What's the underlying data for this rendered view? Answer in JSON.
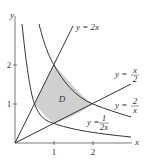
{
  "figure": {
    "axes": {
      "x_label": "x",
      "y_label": "y",
      "x_ticks": [
        "1",
        "2"
      ],
      "y_ticks": [
        "1",
        "2"
      ]
    },
    "curves": [
      {
        "id": "line-2x",
        "label": "y = 2x"
      },
      {
        "id": "line-x2",
        "label_prefix": "y =",
        "label_num": "x",
        "label_den": "2"
      },
      {
        "id": "hyp-2x",
        "label_prefix": "y =",
        "label_num": "2",
        "label_den": "x"
      },
      {
        "id": "hyp-1-2x",
        "label_prefix": "y =",
        "label_num": "1",
        "label_den": "2x"
      }
    ],
    "region": {
      "label": "D",
      "fill": "#d0d0d0"
    },
    "colors": {
      "curve": "#333333",
      "axis": "#555555"
    }
  }
}
